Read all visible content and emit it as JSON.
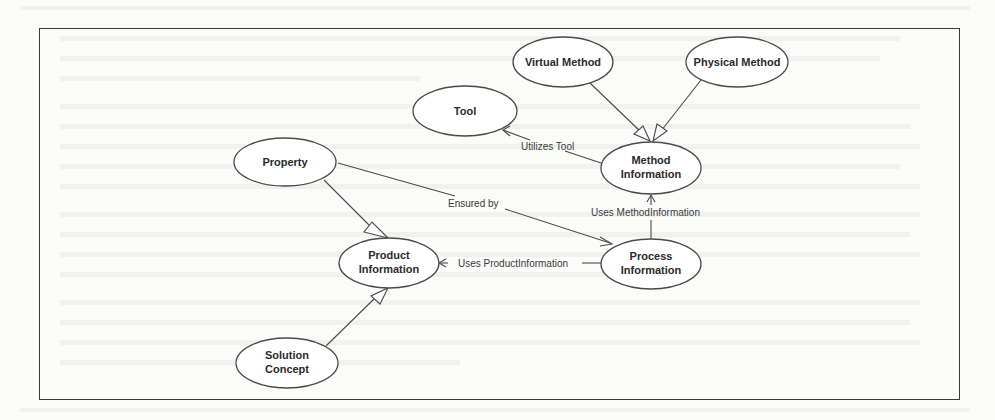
{
  "diagram": {
    "type": "uml-use-case-style concept diagram",
    "frame": {
      "x": 39,
      "y": 28,
      "width": 919,
      "height": 370
    },
    "nodes": [
      {
        "id": "tool",
        "label_lines": [
          "Tool"
        ],
        "cx": 465,
        "cy": 111,
        "rx": 52,
        "ry": 25
      },
      {
        "id": "virtual-method",
        "label_lines": [
          "Virtual Method"
        ],
        "cx": 563,
        "cy": 62,
        "rx": 50,
        "ry": 25
      },
      {
        "id": "physical-method",
        "label_lines": [
          "Physical Method"
        ],
        "cx": 737,
        "cy": 62,
        "rx": 51,
        "ry": 25
      },
      {
        "id": "method-information",
        "label_lines": [
          "Method",
          "Information"
        ],
        "cx": 651,
        "cy": 168,
        "rx": 50,
        "ry": 26
      },
      {
        "id": "property",
        "label_lines": [
          "Property"
        ],
        "cx": 285,
        "cy": 162,
        "rx": 51,
        "ry": 24
      },
      {
        "id": "product-information",
        "label_lines": [
          "Product",
          "Information"
        ],
        "cx": 389,
        "cy": 263,
        "rx": 50,
        "ry": 25
      },
      {
        "id": "process-information",
        "label_lines": [
          "Process",
          "Information"
        ],
        "cx": 651,
        "cy": 264,
        "rx": 50,
        "ry": 25
      },
      {
        "id": "solution-concept",
        "label_lines": [
          "Solution",
          "Concept"
        ],
        "cx": 287,
        "cy": 363,
        "rx": 51,
        "ry": 25
      }
    ],
    "edges": [
      {
        "from": "virtual-method",
        "to": "method-information",
        "kind": "generalization",
        "label": ""
      },
      {
        "from": "physical-method",
        "to": "method-information",
        "kind": "generalization",
        "label": ""
      },
      {
        "from": "method-information",
        "to": "tool",
        "kind": "association",
        "label": "Utilizes Tool"
      },
      {
        "from": "property",
        "to": "product-information",
        "kind": "generalization",
        "label": ""
      },
      {
        "from": "property",
        "to": "process-information",
        "kind": "association",
        "label": "Ensured by"
      },
      {
        "from": "process-information",
        "to": "method-information",
        "kind": "association",
        "label": "Uses MethodInformation"
      },
      {
        "from": "process-information",
        "to": "product-information",
        "kind": "association",
        "label": "Uses ProductInformation"
      },
      {
        "from": "solution-concept",
        "to": "product-information",
        "kind": "generalization",
        "label": ""
      }
    ],
    "labels": {
      "tool": "Tool",
      "virtual_method": "Virtual Method",
      "physical_method": "Physical Method",
      "method_information_1": "Method",
      "method_information_2": "Information",
      "property": "Property",
      "product_information_1": "Product",
      "product_information_2": "Information",
      "process_information_1": "Process",
      "process_information_2": "Information",
      "solution_concept_1": "Solution",
      "solution_concept_2": "Concept",
      "edge_utilizes_tool": "Utilizes Tool",
      "edge_ensured_by": "Ensured by",
      "edge_uses_method_information": "Uses MethodInformation",
      "edge_uses_product_information": "Uses ProductInformation"
    },
    "colors": {
      "stroke": "#4a4a4a",
      "text": "#2b2b2b",
      "background": "#fbfbfa",
      "frame": "#3a3a3a"
    }
  }
}
